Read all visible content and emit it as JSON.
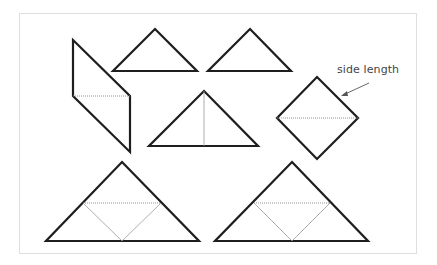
{
  "diagram": {
    "type": "tangram-pieces",
    "annotation": {
      "text": "side length",
      "points_to": "square-piece-upper-right-edge"
    },
    "colors": {
      "outline": "#1e1e1e",
      "dotted": "#888888",
      "frame": "#dedede",
      "background": "#ffffff"
    },
    "pieces": [
      {
        "name": "parallelogram",
        "divided": "horizontal dotted line"
      },
      {
        "name": "small-triangle-1",
        "divided": "none"
      },
      {
        "name": "small-triangle-2",
        "divided": "none"
      },
      {
        "name": "medium-triangle",
        "divided": "vertical line from apex"
      },
      {
        "name": "square",
        "divided": "horizontal dotted diagonal"
      },
      {
        "name": "large-triangle-1",
        "divided": "dotted midline and two lines to base midpoint"
      },
      {
        "name": "large-triangle-2",
        "divided": "dotted midline and two lines to base midpoint"
      }
    ]
  }
}
